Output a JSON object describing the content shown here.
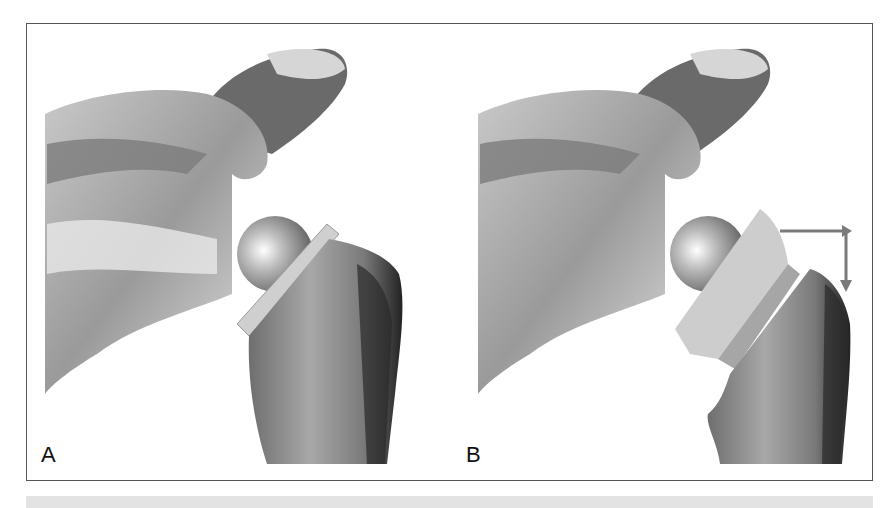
{
  "figure": {
    "panels": [
      {
        "id": "A",
        "label": "A",
        "description": "Scapula with glenosphere; humeral component seated on humerus"
      },
      {
        "id": "B",
        "label": "B",
        "description": "Scapula with glenosphere; humeral component displaced with inferior translation arrow"
      }
    ],
    "arrow": {
      "direction": "right-then-down",
      "color": "#7a7a7a"
    },
    "colors": {
      "border": "#555555",
      "caption_bar": "#e3e3e3",
      "bone_dark": "#3a3a3a",
      "bone_mid": "#8a8a8a",
      "bone_light": "#d8d8d8",
      "implant": "#c8c8c8"
    }
  }
}
